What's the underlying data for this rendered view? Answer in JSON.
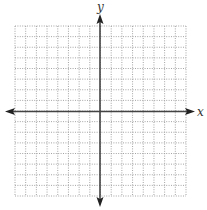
{
  "diagram": {
    "type": "coordinate-grid",
    "x_axis_label": "x",
    "y_axis_label": "y",
    "grid": {
      "columns": 16,
      "rows": 16,
      "left": 15,
      "top": 26,
      "right": 186,
      "bottom": 196,
      "line_style": "dotted",
      "line_color": "#9a9a9a"
    },
    "axes": {
      "origin_x": 100,
      "origin_y": 111.5,
      "x_start": 5,
      "x_end": 195,
      "y_start": 14,
      "y_end": 207,
      "color": "#444444",
      "arrows": "both-ends"
    }
  }
}
